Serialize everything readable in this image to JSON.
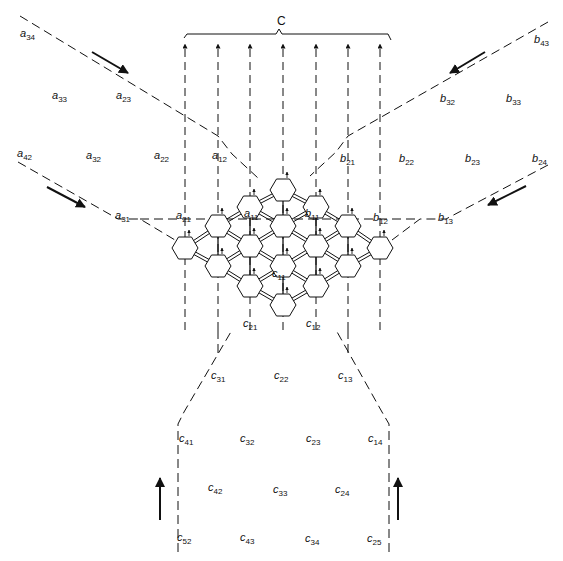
{
  "diagram": {
    "result_label": "C",
    "colors": {
      "stroke": "#111111",
      "background": "#ffffff"
    },
    "labels": [
      {
        "base": "a",
        "sub": "34",
        "x": 20,
        "y": 28
      },
      {
        "base": "a",
        "sub": "33",
        "x": 52,
        "y": 90
      },
      {
        "base": "a",
        "sub": "23",
        "x": 116,
        "y": 90
      },
      {
        "base": "a",
        "sub": "42",
        "x": 17,
        "y": 148
      },
      {
        "base": "a",
        "sub": "32",
        "x": 86,
        "y": 150
      },
      {
        "base": "a",
        "sub": "22",
        "x": 154,
        "y": 150
      },
      {
        "base": "a",
        "sub": "12",
        "x": 212,
        "y": 150
      },
      {
        "base": "a",
        "sub": "31",
        "x": 115,
        "y": 210
      },
      {
        "base": "a",
        "sub": "21",
        "x": 176,
        "y": 210
      },
      {
        "base": "a",
        "sub": "11",
        "x": 244,
        "y": 208
      },
      {
        "base": "b",
        "sub": "43",
        "x": 534,
        "y": 34
      },
      {
        "base": "b",
        "sub": "32",
        "x": 440,
        "y": 93
      },
      {
        "base": "b",
        "sub": "33",
        "x": 506,
        "y": 93
      },
      {
        "base": "b",
        "sub": "21",
        "x": 340,
        "y": 153
      },
      {
        "base": "b",
        "sub": "22",
        "x": 399,
        "y": 153
      },
      {
        "base": "b",
        "sub": "23",
        "x": 465,
        "y": 153
      },
      {
        "base": "b",
        "sub": "24",
        "x": 532,
        "y": 153
      },
      {
        "base": "b",
        "sub": "11",
        "x": 305,
        "y": 208
      },
      {
        "base": "b",
        "sub": "12",
        "x": 373,
        "y": 212
      },
      {
        "base": "b",
        "sub": "13",
        "x": 438,
        "y": 212
      },
      {
        "base": "c",
        "sub": "11",
        "x": 272,
        "y": 268
      },
      {
        "base": "c",
        "sub": "21",
        "x": 243,
        "y": 318
      },
      {
        "base": "c",
        "sub": "12",
        "x": 306,
        "y": 318
      },
      {
        "base": "c",
        "sub": "31",
        "x": 211,
        "y": 370
      },
      {
        "base": "c",
        "sub": "22",
        "x": 274,
        "y": 370
      },
      {
        "base": "c",
        "sub": "13",
        "x": 338,
        "y": 370
      },
      {
        "base": "c",
        "sub": "41",
        "x": 179,
        "y": 433
      },
      {
        "base": "c",
        "sub": "32",
        "x": 240,
        "y": 433
      },
      {
        "base": "c",
        "sub": "23",
        "x": 306,
        "y": 433
      },
      {
        "base": "c",
        "sub": "14",
        "x": 368,
        "y": 433
      },
      {
        "base": "c",
        "sub": "42",
        "x": 208,
        "y": 482
      },
      {
        "base": "c",
        "sub": "33",
        "x": 273,
        "y": 484
      },
      {
        "base": "c",
        "sub": "24",
        "x": 335,
        "y": 484
      },
      {
        "base": "c",
        "sub": "52",
        "x": 177,
        "y": 532
      },
      {
        "base": "c",
        "sub": "43",
        "x": 240,
        "y": 532
      },
      {
        "base": "c",
        "sub": "34",
        "x": 305,
        "y": 533
      },
      {
        "base": "c",
        "sub": "25",
        "x": 367,
        "y": 533
      }
    ]
  }
}
